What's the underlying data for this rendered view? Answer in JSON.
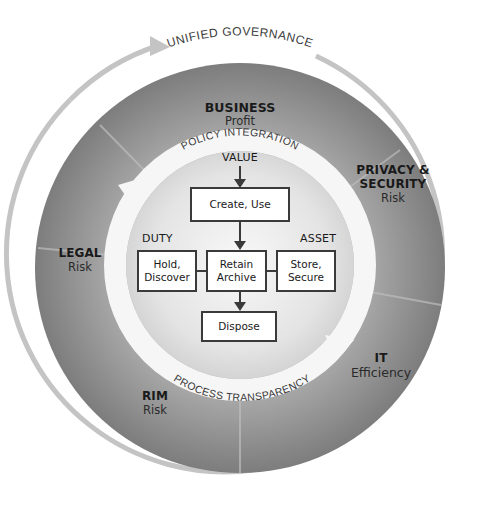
{
  "diagram": {
    "outer_ring_label": "UNIFIED GOVERNANCE",
    "inner_ring_top_label": "POLICY INTEGRATION",
    "inner_ring_bottom_label": "PROCESS TRANSPARENCY",
    "sectors": [
      {
        "id": "business",
        "title": "BUSINESS",
        "subtitle": "Profit"
      },
      {
        "id": "privacy-security",
        "title_line1": "PRIVACY &",
        "title_line2": "SECURITY",
        "subtitle": "Risk"
      },
      {
        "id": "it",
        "title": "IT",
        "subtitle": "Efficiency"
      },
      {
        "id": "rim",
        "title": "RIM",
        "subtitle": "Risk"
      },
      {
        "id": "legal",
        "title": "LEGAL",
        "subtitle": "Risk"
      }
    ],
    "flow": {
      "value_label": "VALUE",
      "duty_label": "DUTY",
      "asset_label": "ASSET",
      "boxes": {
        "create_use": "Create, Use",
        "hold_line1": "Hold,",
        "hold_line2": "Discover",
        "retain_line1": "Retain",
        "retain_line2": "Archive",
        "store_line1": "Store,",
        "store_line2": "Secure",
        "dispose": "Dispose"
      }
    },
    "colors": {
      "outer_dark": "#6e6e6e",
      "outer_mid": "#8c8c8c",
      "center_light": "#f2f2f2",
      "ring_band": "#f7f7f7",
      "outer_arrow": "#bdbdbd",
      "box_border": "#3a3a3a"
    }
  }
}
